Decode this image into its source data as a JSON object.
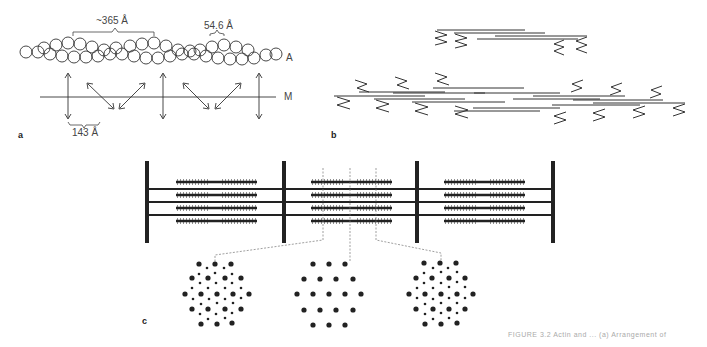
{
  "panel_a": {
    "letter": "a",
    "label_period": "~365 Å",
    "label_subunit": "54.6 Å",
    "label_spacing": "143 Å",
    "label_actin": "A",
    "label_myosin": "M"
  },
  "panel_b": {
    "letter": "b"
  },
  "panel_c": {
    "letter": "c"
  },
  "caption": {
    "text": "FIGURE 3.2  Actin and ...  (a)  Arrangement of"
  },
  "colors": {
    "ink": "#222222",
    "background": "#ffffff"
  }
}
